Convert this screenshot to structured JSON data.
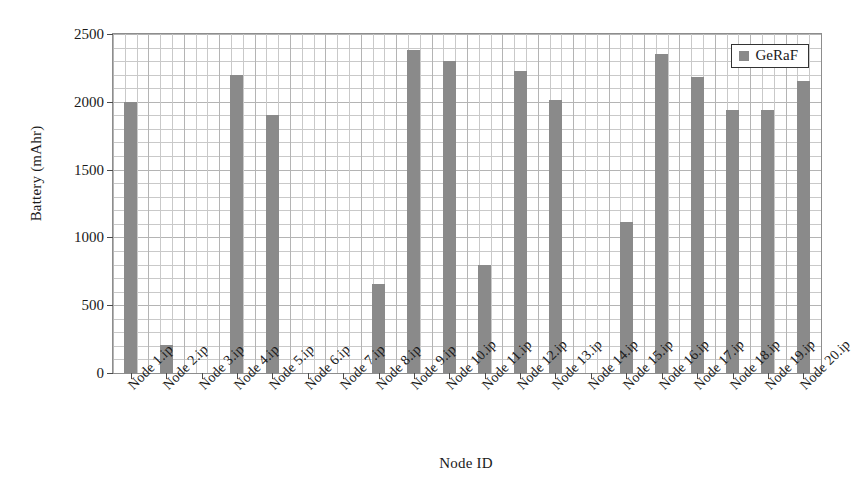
{
  "chart_data": {
    "type": "bar",
    "title": "",
    "xlabel": "Node ID",
    "ylabel": "Battery (mAhr)",
    "ylim": [
      0,
      2500
    ],
    "yticks": [
      0,
      500,
      1000,
      1500,
      2000,
      2500
    ],
    "ytick_labels": [
      "0",
      "500",
      "1000",
      "1500",
      "2000",
      "2500"
    ],
    "grid": true,
    "grid_minor_step": 100,
    "legend_position": "top-right",
    "legend": [
      "GeRaF"
    ],
    "bar_color": "#8a8a8a",
    "categories": [
      "Node 1.ip",
      "Node 2.ip",
      "Node 3.ip",
      "Node 4.ip",
      "Node 5.ip",
      "Node 6.ip",
      "Node 7.ip",
      "Node 8.ip",
      "Node 9.ip",
      "Node 10.ip",
      "Node 11.ip",
      "Node 12.ip",
      "Node 13.ip",
      "Node 14.ip",
      "Node 15.ip",
      "Node 16.ip",
      "Node 17.ip",
      "Node 18.ip",
      "Node 19.ip",
      "Node 20.ip"
    ],
    "series": [
      {
        "name": "GeRaF",
        "values": [
          2000,
          210,
          0,
          2200,
          1900,
          0,
          0,
          660,
          2380,
          2300,
          800,
          2230,
          2010,
          0,
          1110,
          2350,
          2180,
          1940,
          1940,
          2155
        ]
      }
    ]
  },
  "legend": {
    "swatch_color": "#8a8a8a",
    "label": "GeRaF"
  },
  "axes": {
    "ylabel": "Battery (mAhr)",
    "xlabel": "Node ID"
  }
}
